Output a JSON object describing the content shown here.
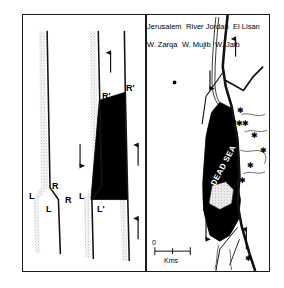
{
  "figure": {
    "colors": {
      "ink": "#1a1a1a",
      "basin_fill": "#000000",
      "stipple": "#9a9a9a",
      "paper": "#ffffff"
    }
  },
  "panel_left": {
    "name": "pull-apart-model",
    "diagram_a": {
      "labels": [
        {
          "text": "R",
          "role": "releasing-bend-upper-right"
        },
        {
          "text": "L",
          "role": "left-upper"
        },
        {
          "text": "R",
          "role": "releasing-bend-lower-right"
        },
        {
          "text": "L",
          "role": "left-lower"
        }
      ]
    },
    "diagram_b": {
      "labels": [
        {
          "text": "R'",
          "role": "basin-top-left"
        },
        {
          "text": "R'",
          "role": "basin-top-right"
        },
        {
          "text": "L",
          "role": "basin-bottom-left"
        },
        {
          "text": "L'",
          "role": "basin-bottom-right"
        }
      ],
      "arrow_count": 4,
      "arrow_directions": [
        "up",
        "down",
        "up",
        "up"
      ]
    }
  },
  "panel_right": {
    "name": "dead-sea-map",
    "places": [
      {
        "text": "Jerusalem",
        "type": "city"
      },
      {
        "text": "River Jordan",
        "type": "river",
        "rotated": true
      },
      {
        "text": "DEAD SEA",
        "type": "sea",
        "rotated": true
      },
      {
        "text": "El Lisan",
        "type": "peninsula"
      },
      {
        "text": "W. Zarqa",
        "type": "wadi"
      },
      {
        "text": "W. Mujib",
        "type": "wadi"
      },
      {
        "text": "W. Jaib",
        "type": "wadi",
        "rotated": true
      }
    ],
    "scale": {
      "zero_label": "0",
      "unit_label": "Kms"
    },
    "arrows": {
      "count": 4,
      "directions": [
        "up",
        "down",
        "down",
        "up"
      ]
    },
    "epicenter_symbol": "star",
    "epicenter_count": 9
  }
}
